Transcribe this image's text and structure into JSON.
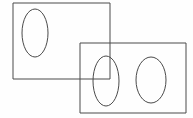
{
  "figure": {
    "canvas": {
      "width": 193,
      "height": 118,
      "background_color": "#fefefe"
    },
    "style": {
      "stroke_color": "#4a4a4a",
      "stroke_width": 1,
      "fill": "none"
    },
    "shapes": [
      {
        "name": "rectangle-left",
        "type": "rect",
        "x": 13,
        "y": 3,
        "width": 97,
        "height": 76
      },
      {
        "name": "rectangle-right",
        "type": "rect",
        "x": 80,
        "y": 43,
        "width": 106,
        "height": 70
      },
      {
        "name": "ellipse-left",
        "type": "ellipse",
        "cx": 35,
        "cy": 33,
        "rx": 13,
        "ry": 24
      },
      {
        "name": "ellipse-middle",
        "type": "ellipse",
        "cx": 106,
        "cy": 81,
        "rx": 13,
        "ry": 25
      },
      {
        "name": "ellipse-right",
        "type": "ellipse",
        "cx": 151,
        "cy": 80,
        "rx": 15,
        "ry": 23
      }
    ]
  }
}
